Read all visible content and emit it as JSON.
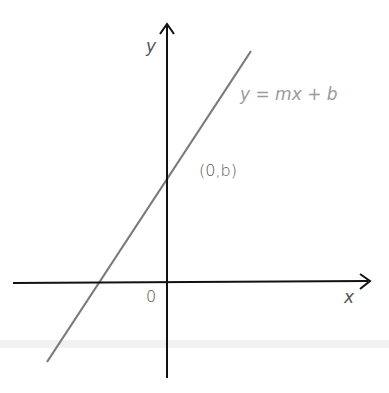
{
  "diagram": {
    "y_axis_label": "y",
    "x_axis_label": "x",
    "origin_label": "0",
    "line_label": "y = mx + b",
    "intercept_label": "(0,b)",
    "colors": {
      "axes": "#111111",
      "line": "#7a7a7a",
      "label": "#555555",
      "line_label": "#9a9a9a",
      "band": "#e6e6e6"
    }
  }
}
